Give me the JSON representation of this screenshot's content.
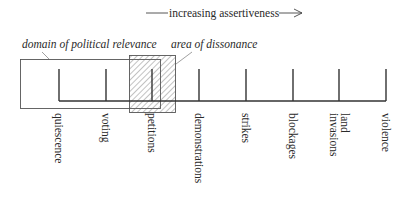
{
  "figure": {
    "axis_title": "increasing assertiveness",
    "regions": {
      "domain": {
        "label": "domain of political relevance"
      },
      "dissonance": {
        "label": "area of dissonance"
      }
    },
    "categories": [
      {
        "id": "quiescence",
        "lines": [
          "quiescence"
        ]
      },
      {
        "id": "voting",
        "lines": [
          "voting"
        ]
      },
      {
        "id": "petitions",
        "lines": [
          "petitions"
        ]
      },
      {
        "id": "demonstrations",
        "lines": [
          "demonstrations"
        ]
      },
      {
        "id": "strikes",
        "lines": [
          "strikes"
        ]
      },
      {
        "id": "blockages",
        "lines": [
          "blockages"
        ]
      },
      {
        "id": "land-invasions",
        "lines": [
          "land",
          "invasions"
        ]
      },
      {
        "id": "violence",
        "lines": [
          "violence"
        ]
      }
    ],
    "colors": {
      "line": "#333333",
      "box": "#555555",
      "hatch": "#666666",
      "text": "#2a2a2a"
    }
  }
}
